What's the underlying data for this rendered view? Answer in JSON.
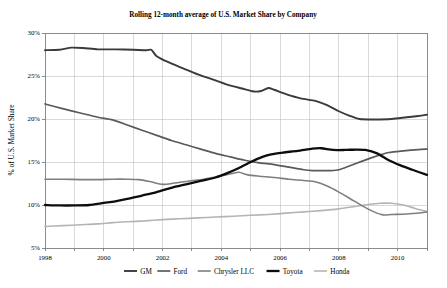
{
  "chart_data": {
    "type": "line",
    "title": "Rolling 12-month average of U.S. Market Share by Company",
    "xlabel": "",
    "ylabel": "% of U.S. Market Share",
    "xlim": [
      1998,
      2011
    ],
    "ylim": [
      5,
      30
    ],
    "grid": true,
    "legend_position": "bottom",
    "x_ticks": [
      1998,
      1999,
      2000,
      2001,
      2002,
      2003,
      2004,
      2005,
      2006,
      2007,
      2008,
      2009,
      2010,
      2011
    ],
    "x_tick_labels": [
      "1998",
      "",
      "2000",
      "",
      "2002",
      "",
      "2004",
      "",
      "2006",
      "",
      "2008",
      "",
      "2010",
      ""
    ],
    "y_ticks": [
      5,
      10,
      15,
      20,
      25,
      30
    ],
    "y_tick_labels": [
      "5%",
      "10%",
      "15%",
      "20%",
      "25%",
      "30%"
    ],
    "series": [
      {
        "name": "GM",
        "color": "#3a3a3a",
        "width": 1.9,
        "x": [
          1998.0,
          1998.5,
          1998.9,
          1999.3,
          1999.8,
          2000.4,
          2001.0,
          2001.45,
          2001.62,
          2001.8,
          2002.2,
          2002.7,
          2003.2,
          2003.7,
          2004.2,
          2004.7,
          2005.1,
          2005.35,
          2005.6,
          2005.8,
          2006.2,
          2006.7,
          2007.2,
          2007.6,
          2008.0,
          2008.35,
          2008.7,
          2009.2,
          2009.8,
          2010.3,
          2010.7,
          2011.0
        ],
        "y": [
          28.0,
          28.05,
          28.3,
          28.25,
          28.1,
          28.1,
          28.05,
          28.0,
          28.05,
          27.3,
          26.6,
          25.9,
          25.2,
          24.6,
          24.0,
          23.55,
          23.2,
          23.25,
          23.6,
          23.4,
          22.9,
          22.4,
          22.1,
          21.6,
          20.9,
          20.4,
          20.0,
          19.95,
          20.0,
          20.2,
          20.35,
          20.5
        ]
      },
      {
        "name": "Ford",
        "color": "#5a5a5a",
        "width": 1.7,
        "x": [
          1998.0,
          1998.6,
          1999.2,
          1999.8,
          2000.3,
          2000.8,
          2001.3,
          2001.8,
          2002.3,
          2002.8,
          2003.3,
          2003.8,
          2004.3,
          2004.8,
          2005.3,
          2005.8,
          2006.3,
          2006.8,
          2007.1,
          2007.4,
          2007.7,
          2008.0,
          2008.4,
          2008.8,
          2009.2,
          2009.7,
          2010.2,
          2010.7,
          2011.0
        ],
        "y": [
          21.75,
          21.2,
          20.7,
          20.2,
          19.9,
          19.3,
          18.7,
          18.1,
          17.5,
          17.0,
          16.5,
          16.0,
          15.6,
          15.2,
          14.9,
          14.7,
          14.4,
          14.1,
          14.0,
          14.0,
          14.0,
          14.1,
          14.6,
          15.1,
          15.6,
          16.1,
          16.3,
          16.45,
          16.5
        ]
      },
      {
        "name": "Chrysler LLC",
        "color": "#7e7e7e",
        "width": 1.6,
        "x": [
          1998.0,
          1998.6,
          1999.2,
          1999.8,
          2000.3,
          2000.8,
          2001.2,
          2001.6,
          2002.0,
          2002.4,
          2002.9,
          2003.4,
          2003.9,
          2004.3,
          2004.6,
          2004.9,
          2005.3,
          2005.8,
          2006.3,
          2006.8,
          2007.2,
          2007.6,
          2008.0,
          2008.4,
          2008.8,
          2009.2,
          2009.5,
          2009.8,
          2010.3,
          2010.8,
          2011.0
        ],
        "y": [
          13.0,
          13.0,
          12.95,
          12.95,
          13.0,
          13.0,
          12.95,
          12.7,
          12.4,
          12.55,
          12.8,
          13.0,
          13.3,
          13.6,
          13.8,
          13.5,
          13.35,
          13.2,
          13.0,
          12.85,
          12.7,
          12.2,
          11.5,
          10.7,
          9.9,
          9.2,
          8.85,
          8.9,
          8.95,
          9.1,
          9.2
        ]
      },
      {
        "name": "Toyota",
        "color": "#0d0d0d",
        "width": 2.3,
        "x": [
          1998.0,
          1998.5,
          1999.0,
          1999.5,
          2000.0,
          2000.35,
          2000.8,
          2001.3,
          2001.8,
          2002.3,
          2002.8,
          2003.3,
          2003.8,
          2004.2,
          2004.6,
          2005.0,
          2005.4,
          2005.7,
          2006.1,
          2006.6,
          2007.1,
          2007.4,
          2007.8,
          2008.2,
          2008.6,
          2008.9,
          2009.3,
          2009.7,
          2010.1,
          2010.5,
          2011.0
        ],
        "y": [
          10.0,
          9.95,
          9.95,
          10.0,
          10.25,
          10.4,
          10.7,
          11.1,
          11.5,
          12.0,
          12.4,
          12.8,
          13.2,
          13.7,
          14.3,
          15.0,
          15.6,
          15.9,
          16.1,
          16.3,
          16.55,
          16.6,
          16.4,
          16.4,
          16.45,
          16.4,
          16.0,
          15.2,
          14.6,
          14.1,
          13.5
        ]
      },
      {
        "name": "Honda",
        "color": "#b4b4b4",
        "width": 1.6,
        "x": [
          1998.0,
          1998.6,
          1999.2,
          1999.8,
          2000.3,
          2000.8,
          2001.4,
          2002.0,
          2002.6,
          2003.2,
          2003.8,
          2004.4,
          2005.0,
          2005.6,
          2006.2,
          2006.8,
          2007.4,
          2008.0,
          2008.5,
          2009.0,
          2009.4,
          2009.8,
          2010.2,
          2010.6,
          2011.0
        ],
        "y": [
          7.5,
          7.6,
          7.7,
          7.8,
          7.95,
          8.05,
          8.15,
          8.3,
          8.4,
          8.5,
          8.6,
          8.7,
          8.8,
          8.9,
          9.05,
          9.2,
          9.35,
          9.55,
          9.8,
          10.05,
          10.2,
          10.2,
          10.0,
          9.6,
          9.25
        ]
      }
    ]
  },
  "legend": {
    "items": [
      {
        "label": "GM"
      },
      {
        "label": "Ford"
      },
      {
        "label": "Chrysler LLC"
      },
      {
        "label": "Toyota"
      },
      {
        "label": "Honda"
      }
    ]
  }
}
